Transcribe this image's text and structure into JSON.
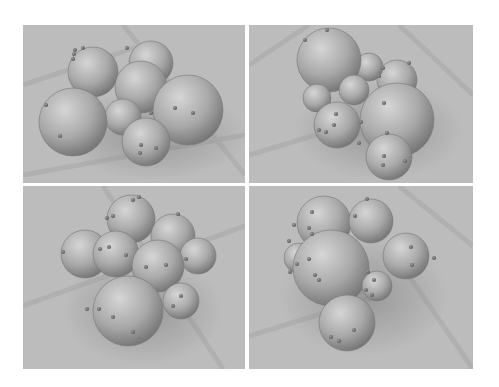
{
  "figure": {
    "background": "#ffffff",
    "floor_color": "#bcbcbc",
    "floor_line_color": "#b0b0b0",
    "sphere_light": "#d6d6d6",
    "sphere_mid": "#a9a9a9",
    "sphere_dark": "#6e6e6e",
    "dot_color": "#555555",
    "panels": [
      {
        "id": "top-left",
        "x": 0,
        "y": 0,
        "w": 222,
        "h": 158,
        "floor_lines": [
          [
            0,
            60,
            120,
            20
          ],
          [
            100,
            0,
            222,
            150
          ],
          [
            0,
            150,
            222,
            110
          ]
        ],
        "shadow": {
          "cx": 130,
          "cy": 110,
          "rx": 95,
          "ry": 45
        },
        "spheres": [
          {
            "cx": 128,
            "cy": 38,
            "r": 22
          },
          {
            "cx": 70,
            "cy": 47,
            "r": 25
          },
          {
            "cx": 118,
            "cy": 62,
            "r": 26
          },
          {
            "cx": 165,
            "cy": 85,
            "r": 35
          },
          {
            "cx": 100,
            "cy": 92,
            "r": 18
          },
          {
            "cx": 50,
            "cy": 97,
            "r": 34
          },
          {
            "cx": 123,
            "cy": 117,
            "r": 24
          }
        ],
        "dots": [
          [
            51,
            29
          ],
          [
            50,
            34
          ],
          [
            52,
            25
          ],
          [
            60,
            23
          ],
          [
            104,
            23
          ],
          [
            23,
            80
          ],
          [
            37,
            111
          ],
          [
            152,
            83
          ],
          [
            170,
            88
          ],
          [
            128,
            88
          ],
          [
            118,
            120
          ],
          [
            117,
            128
          ],
          [
            133,
            123
          ]
        ]
      },
      {
        "id": "top-right",
        "x": 226,
        "y": 0,
        "w": 224,
        "h": 158,
        "floor_lines": [
          [
            0,
            40,
            60,
            0
          ],
          [
            150,
            0,
            224,
            70
          ],
          [
            0,
            130,
            100,
            100
          ]
        ],
        "shadow": {
          "cx": 130,
          "cy": 105,
          "rx": 85,
          "ry": 50
        },
        "spheres": [
          {
            "cx": 148,
            "cy": 55,
            "r": 20
          },
          {
            "cx": 120,
            "cy": 42,
            "r": 14
          },
          {
            "cx": 80,
            "cy": 35,
            "r": 32
          },
          {
            "cx": 68,
            "cy": 73,
            "r": 14
          },
          {
            "cx": 105,
            "cy": 65,
            "r": 15
          },
          {
            "cx": 148,
            "cy": 95,
            "r": 37
          },
          {
            "cx": 88,
            "cy": 100,
            "r": 23
          },
          {
            "cx": 140,
            "cy": 132,
            "r": 23
          }
        ],
        "dots": [
          [
            78,
            5
          ],
          [
            56,
            15
          ],
          [
            160,
            38
          ],
          [
            134,
            43
          ],
          [
            130,
            51
          ],
          [
            135,
            78
          ],
          [
            87,
            89
          ],
          [
            85,
            100
          ],
          [
            70,
            105
          ],
          [
            77,
            107
          ],
          [
            112,
            97
          ],
          [
            138,
            108
          ],
          [
            110,
            118
          ],
          [
            135,
            131
          ],
          [
            134,
            140
          ],
          [
            156,
            136
          ]
        ]
      },
      {
        "id": "bottom-left",
        "x": 0,
        "y": 161,
        "w": 222,
        "h": 183,
        "floor_lines": [
          [
            0,
            120,
            222,
            40
          ],
          [
            80,
            0,
            200,
            183
          ]
        ],
        "shadow": {
          "cx": 120,
          "cy": 125,
          "rx": 80,
          "ry": 55
        },
        "spheres": [
          {
            "cx": 108,
            "cy": 33,
            "r": 24
          },
          {
            "cx": 150,
            "cy": 50,
            "r": 22
          },
          {
            "cx": 175,
            "cy": 70,
            "r": 18
          },
          {
            "cx": 62,
            "cy": 68,
            "r": 24
          },
          {
            "cx": 93,
            "cy": 68,
            "r": 23
          },
          {
            "cx": 135,
            "cy": 80,
            "r": 26
          },
          {
            "cx": 158,
            "cy": 115,
            "r": 18
          },
          {
            "cx": 105,
            "cy": 125,
            "r": 35
          }
        ],
        "dots": [
          [
            110,
            14
          ],
          [
            116,
            11
          ],
          [
            84,
            32
          ],
          [
            90,
            30
          ],
          [
            155,
            28
          ],
          [
            40,
            66
          ],
          [
            77,
            63
          ],
          [
            86,
            61
          ],
          [
            103,
            69
          ],
          [
            123,
            81
          ],
          [
            143,
            79
          ],
          [
            163,
            73
          ],
          [
            64,
            123
          ],
          [
            76,
            123
          ],
          [
            90,
            131
          ],
          [
            110,
            146
          ],
          [
            150,
            120
          ],
          [
            158,
            110
          ]
        ]
      },
      {
        "id": "bottom-right",
        "x": 226,
        "y": 161,
        "w": 224,
        "h": 183,
        "floor_lines": [
          [
            0,
            150,
            130,
            110
          ],
          [
            160,
            90,
            224,
            183
          ],
          [
            150,
            0,
            224,
            60
          ]
        ],
        "shadow": {
          "cx": 115,
          "cy": 110,
          "rx": 85,
          "ry": 60
        },
        "spheres": [
          {
            "cx": 75,
            "cy": 37,
            "r": 27
          },
          {
            "cx": 122,
            "cy": 35,
            "r": 22
          },
          {
            "cx": 157,
            "cy": 70,
            "r": 23
          },
          {
            "cx": 50,
            "cy": 72,
            "r": 15
          },
          {
            "cx": 82,
            "cy": 82,
            "r": 38
          },
          {
            "cx": 128,
            "cy": 100,
            "r": 15
          },
          {
            "cx": 98,
            "cy": 137,
            "r": 28
          }
        ],
        "dots": [
          [
            63,
            26
          ],
          [
            45,
            39
          ],
          [
            60,
            42
          ],
          [
            63,
            48
          ],
          [
            40,
            55
          ],
          [
            48,
            78
          ],
          [
            41,
            86
          ],
          [
            60,
            73
          ],
          [
            66,
            89
          ],
          [
            70,
            94
          ],
          [
            106,
            30
          ],
          [
            118,
            13
          ],
          [
            162,
            61
          ],
          [
            163,
            79
          ],
          [
            185,
            72
          ],
          [
            119,
            86
          ],
          [
            125,
            94
          ],
          [
            117,
            104
          ],
          [
            123,
            109
          ],
          [
            82,
            151
          ],
          [
            90,
            155
          ],
          [
            105,
            144
          ]
        ]
      }
    ]
  }
}
